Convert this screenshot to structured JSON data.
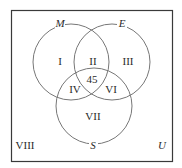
{
  "diagram": {
    "type": "venn",
    "universe_label": "U",
    "sets": [
      {
        "name": "M"
      },
      {
        "name": "E"
      },
      {
        "name": "S"
      }
    ],
    "regions": {
      "r1": "I",
      "r2": "II",
      "r3": "III",
      "r4": "IV",
      "center": "45",
      "r6": "VI",
      "r7": "VII",
      "r8": "VIII"
    },
    "colors": {
      "border": "#3a3a3a",
      "circle": "#777777",
      "text": "#2a2a2a"
    }
  }
}
